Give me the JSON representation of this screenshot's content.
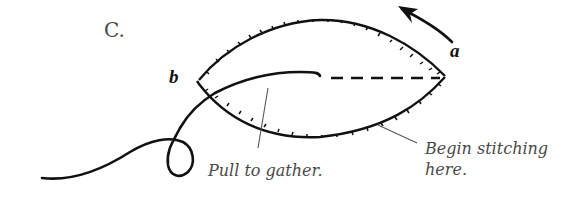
{
  "figure": {
    "panel_label": "C.",
    "point_a_label": "a",
    "point_b_label": "b",
    "callouts": {
      "pull_to_gather": "Pull to gather.",
      "begin_stitching_line1": "Begin stitching",
      "begin_stitching_line2": "here."
    }
  },
  "colors": {
    "stroke": "#111111",
    "label_text": "#4a4a4a",
    "leader_line": "#555555"
  }
}
